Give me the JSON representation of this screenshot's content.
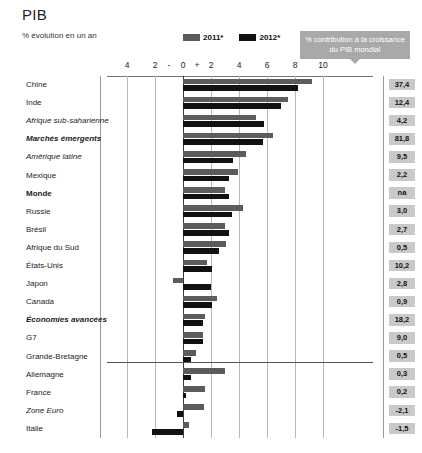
{
  "header": {
    "title": "PIB",
    "subtitle": "% évolution en un an",
    "contribution_box": "% contribution à la croissance du PIB mondial"
  },
  "legend": [
    {
      "label": "2011*",
      "color": "#5c5c5c"
    },
    {
      "label": "2012*",
      "color": "#111111"
    }
  ],
  "axis": {
    "tick_labels": [
      "4",
      "2",
      "-",
      "0",
      "+",
      "2",
      "4",
      "6",
      "8",
      "10"
    ],
    "tick_values": [
      -4,
      -2,
      -1,
      0,
      1,
      2,
      4,
      6,
      8,
      10
    ],
    "min": -4,
    "max": 10
  },
  "chart_data": {
    "type": "bar",
    "orientation": "horizontal",
    "title": "PIB",
    "subtitle": "% évolution en un an",
    "xlabel": "% évolution en un an",
    "ylabel": "",
    "xlim": [
      -4,
      10
    ],
    "grid": true,
    "legend_position": "top-center",
    "categories": [
      "Chine",
      "Inde",
      "Afrique sub-saharienne",
      "Marchés émergents",
      "Amérique latine",
      "Mexique",
      "Monde",
      "Russie",
      "Brésil",
      "Afrique du Sud",
      "États-Unis",
      "Japon",
      "Canada",
      "Économies avancées",
      "G7",
      "Grande-Bretagne",
      "Allemagne",
      "France",
      "Zone Euro",
      "Italie"
    ],
    "series": [
      {
        "name": "2011*",
        "color": "#5c5c5c",
        "values": [
          9.2,
          7.5,
          5.2,
          6.4,
          4.5,
          3.9,
          3.0,
          4.3,
          3.0,
          3.1,
          1.7,
          -0.7,
          2.4,
          1.6,
          1.4,
          0.9,
          3.0,
          1.6,
          1.5,
          0.4
        ]
      },
      {
        "name": "2012*",
        "color": "#111111",
        "values": [
          8.2,
          7.0,
          5.8,
          5.7,
          3.6,
          3.3,
          3.3,
          3.5,
          3.3,
          2.6,
          2.1,
          2.0,
          2.1,
          1.4,
          1.4,
          0.6,
          0.6,
          0.2,
          -0.4,
          -2.2
        ]
      }
    ],
    "contribution_column": {
      "header": "% contribution à la croissance du PIB mondial",
      "values": [
        "37,4",
        "12,4",
        "4,2",
        "81,8",
        "9,5",
        "2,2",
        "na",
        "3,0",
        "2,7",
        "0,5",
        "10,2",
        "2,8",
        "0,9",
        "18,2",
        "9,0",
        "0,5",
        "0,3",
        "0,2",
        "-2,1",
        "-1,5"
      ]
    }
  },
  "rows": [
    {
      "label": "Chine",
      "style": "normal",
      "v2011": 9.2,
      "v2012": 8.2,
      "contribution": "37,4"
    },
    {
      "label": "Inde",
      "style": "normal",
      "v2011": 7.5,
      "v2012": 7.0,
      "contribution": "12,4"
    },
    {
      "label": "Afrique sub-saharienne",
      "style": "italic",
      "v2011": 5.2,
      "v2012": 5.8,
      "contribution": "4,2"
    },
    {
      "label": "Marchés émergents",
      "style": "bolditalic",
      "v2011": 6.4,
      "v2012": 5.7,
      "contribution": "81,8"
    },
    {
      "label": "Amérique latine",
      "style": "italic",
      "v2011": 4.5,
      "v2012": 3.6,
      "contribution": "9,5"
    },
    {
      "label": "Mexique",
      "style": "normal",
      "v2011": 3.9,
      "v2012": 3.3,
      "contribution": "2,2"
    },
    {
      "label": "Monde",
      "style": "bold",
      "v2011": 3.0,
      "v2012": 3.3,
      "contribution": "na"
    },
    {
      "label": "Russie",
      "style": "normal",
      "v2011": 4.3,
      "v2012": 3.5,
      "contribution": "3,0"
    },
    {
      "label": "Brésil",
      "style": "normal",
      "v2011": 3.0,
      "v2012": 3.3,
      "contribution": "2,7"
    },
    {
      "label": "Afrique du Sud",
      "style": "normal",
      "v2011": 3.1,
      "v2012": 2.6,
      "contribution": "0,5"
    },
    {
      "label": "États-Unis",
      "style": "normal",
      "v2011": 1.7,
      "v2012": 2.1,
      "contribution": "10,2"
    },
    {
      "label": "Japon",
      "style": "normal",
      "v2011": -0.7,
      "v2012": 2.0,
      "contribution": "2,8"
    },
    {
      "label": "Canada",
      "style": "normal",
      "v2011": 2.4,
      "v2012": 2.1,
      "contribution": "0,9"
    },
    {
      "label": "Économies avancées",
      "style": "bolditalic",
      "v2011": 1.6,
      "v2012": 1.4,
      "contribution": "18,2"
    },
    {
      "label": "G7",
      "style": "normal",
      "v2011": 1.4,
      "v2012": 1.4,
      "contribution": "9,0"
    },
    {
      "label": "Grande-Bretagne",
      "style": "normal",
      "v2011": 0.9,
      "v2012": 0.6,
      "contribution": "0,5"
    },
    {
      "label": "Allemagne",
      "style": "normal",
      "v2011": 3.0,
      "v2012": 0.6,
      "contribution": "0,3"
    },
    {
      "label": "France",
      "style": "normal",
      "v2011": 1.6,
      "v2012": 0.2,
      "contribution": "0,2"
    },
    {
      "label": "Zone Euro",
      "style": "italic",
      "v2011": 1.5,
      "v2012": -0.4,
      "contribution": "-2,1"
    },
    {
      "label": "Italie",
      "style": "normal",
      "v2011": 0.4,
      "v2012": -2.2,
      "contribution": "-1,5"
    }
  ]
}
